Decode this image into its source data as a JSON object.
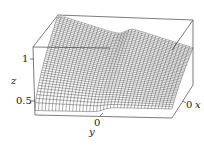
{
  "chart_data": {
    "type": "surface3d",
    "title": "",
    "axes": {
      "x": {
        "label": "x",
        "ticks": [
          "0"
        ]
      },
      "y": {
        "label": "y",
        "ticks": [
          "0"
        ]
      },
      "z": {
        "label": "z",
        "ticks": [
          "0.5",
          "1"
        ],
        "range": [
          0.4,
          1.15
        ]
      }
    },
    "mesh": {
      "rows": 40,
      "cols": 40
    },
    "colors": {
      "line": "#1a1a1a",
      "box": "#444444",
      "background": "#ffffff"
    }
  },
  "labels": {
    "z_axis": "z",
    "z_tick_high": "1",
    "z_tick_low": "0.5",
    "y_axis": "y",
    "y_tick": "0",
    "x_axis": "x",
    "x_tick": "0"
  }
}
